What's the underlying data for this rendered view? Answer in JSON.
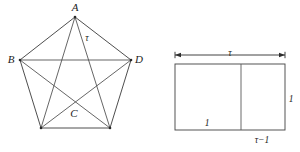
{
  "figure": {
    "background_color": "#ffffff",
    "line_color": "#3a3a3a",
    "text_color": "#1c1c1c"
  },
  "pentagon": {
    "name": "regular-pentagon-complete-graph",
    "description": "Regular pentagon with all five vertices joined by every edge and diagonal (complete graph K5), forming an inscribed pentagram.",
    "vertices": [
      {
        "id": "A",
        "label": "A",
        "x": 75,
        "y": 17,
        "label_x": 75,
        "label_y": 8,
        "labelled": true
      },
      {
        "id": "D",
        "label": "D",
        "x": 131,
        "y": 60,
        "label_x": 139,
        "label_y": 60,
        "labelled": true
      },
      {
        "id": "E",
        "label": "",
        "x": 110,
        "y": 128,
        "label_x": 110,
        "label_y": 128,
        "labelled": false
      },
      {
        "id": "F",
        "label": "",
        "x": 41,
        "y": 128,
        "label_x": 41,
        "label_y": 128,
        "labelled": false
      },
      {
        "id": "B",
        "label": "B",
        "x": 20,
        "y": 60,
        "label_x": 11,
        "label_y": 60,
        "labelled": true
      }
    ],
    "edges": [
      {
        "from": "A",
        "to": "D",
        "kind": "side"
      },
      {
        "from": "D",
        "to": "E",
        "kind": "side"
      },
      {
        "from": "E",
        "to": "F",
        "kind": "side"
      },
      {
        "from": "F",
        "to": "B",
        "kind": "side"
      },
      {
        "from": "B",
        "to": "A",
        "kind": "side"
      },
      {
        "from": "A",
        "to": "E",
        "kind": "diagonal"
      },
      {
        "from": "A",
        "to": "F",
        "kind": "diagonal"
      },
      {
        "from": "B",
        "to": "D",
        "kind": "diagonal"
      },
      {
        "from": "B",
        "to": "E",
        "kind": "diagonal"
      },
      {
        "from": "D",
        "to": "F",
        "kind": "diagonal"
      }
    ],
    "interior_labels": [
      {
        "id": "C",
        "label": "C",
        "x": 74,
        "y": 114
      },
      {
        "id": "tau",
        "label": "τ",
        "x": 87,
        "y": 39
      }
    ]
  },
  "rectangle": {
    "name": "golden-rectangle-decomposition",
    "description": "Golden rectangle of width tau and height 1, split by a vertical line into a unit square of side 1 and a residual rectangle of width tau minus 1.",
    "outer": {
      "x": 175,
      "y": 64,
      "width": 110,
      "height": 66
    },
    "divider_x": 241,
    "dimension_arrow": {
      "name": "width-dimension-arrow",
      "y": 55,
      "x_start": 175,
      "x_end": 285,
      "label": "τ",
      "label_x": 230,
      "label_y": 54
    },
    "labels": [
      {
        "id": "square-base",
        "label": "1",
        "x": 207,
        "y": 124
      },
      {
        "id": "height-right",
        "label": "1",
        "x": 291,
        "y": 100
      },
      {
        "id": "residual-width",
        "label": "τ−1",
        "x": 262,
        "y": 141
      }
    ]
  }
}
